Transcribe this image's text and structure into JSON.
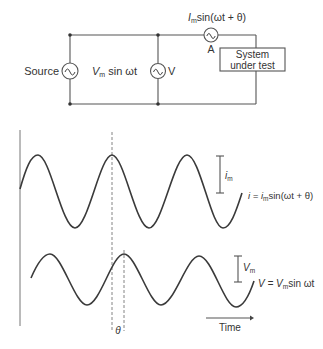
{
  "circuit": {
    "source_label": "Source",
    "source_expr_prefix": "V",
    "source_expr_sub": "m",
    "source_expr_rest": " sin ωt",
    "voltmeter_label": "V",
    "ammeter_label": "A",
    "ammeter_expr_prefix": "I",
    "ammeter_expr_sub": "m",
    "ammeter_expr_rest": "sin(ωt + θ)",
    "box_line1": "System",
    "box_line2": "under test",
    "source_icon": "ac-source-icon",
    "voltmeter_icon": "ac-meter-icon",
    "ammeter_icon": "ac-meter-icon"
  },
  "waveforms": {
    "current": {
      "amp_label_prefix": "i",
      "amp_label_sub": "m",
      "equation": "i = i",
      "equation_sub": "m",
      "equation_rest": "sin(ωt + θ)"
    },
    "voltage": {
      "amp_label_prefix": "V",
      "amp_label_sub": "m",
      "equation": "V = V",
      "equation_sub": "m",
      "equation_rest": "sin ωt"
    },
    "phase_label": "θ",
    "time_label": "Time"
  }
}
